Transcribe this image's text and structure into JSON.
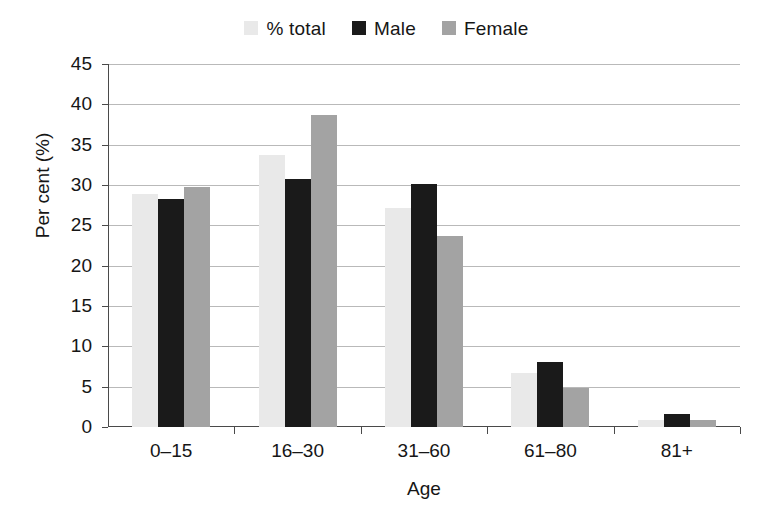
{
  "chart_data": {
    "type": "bar",
    "title": "",
    "xlabel": "Age",
    "ylabel": "Per cent (%)",
    "categories": [
      "0–15",
      "16–30",
      "31–60",
      "61–80",
      "81+"
    ],
    "ylim": [
      0,
      45
    ],
    "ytick_step": 5,
    "ytick_labels": [
      "45",
      "40",
      "35",
      "30",
      "25",
      "20",
      "15",
      "10",
      "5",
      "0"
    ],
    "ytick_values": [
      45,
      40,
      35,
      30,
      25,
      20,
      15,
      10,
      5,
      0
    ],
    "grid": true,
    "legend_position": "top-center",
    "series": [
      {
        "name": "% total",
        "color": "#e9e9e9",
        "values": [
          28.9,
          33.7,
          27.1,
          6.7,
          0.9
        ]
      },
      {
        "name": "Male",
        "color": "#1a1a1a",
        "values": [
          28.3,
          30.8,
          30.1,
          8.0,
          1.6
        ]
      },
      {
        "name": "Female",
        "color": "#a3a3a3",
        "values": [
          29.8,
          38.7,
          23.7,
          4.8,
          0.9
        ]
      }
    ]
  },
  "colors": {
    "axis": "#4a4a4a",
    "grid": "#b9b9b9",
    "text": "#161616",
    "background": "#ffffff"
  }
}
